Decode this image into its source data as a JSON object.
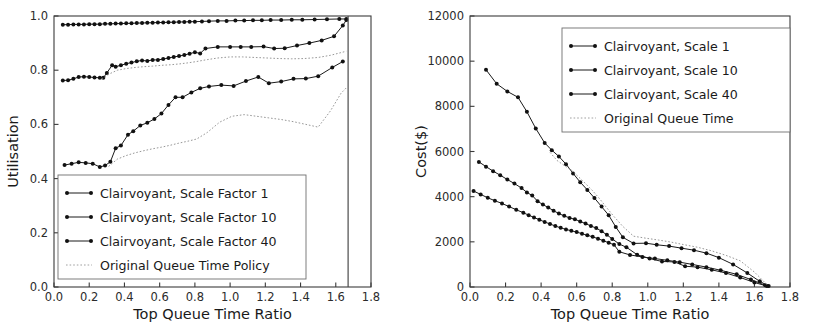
{
  "figure": {
    "background": "#ffffff",
    "ink": "#1a1a1a",
    "grid": false
  },
  "chart_data": [
    {
      "id": "utilisation",
      "type": "line",
      "title": "",
      "xlabel": "Top Queue Time Ratio",
      "ylabel": "Utilisation",
      "xlim": [
        0.0,
        1.8
      ],
      "ylim": [
        0.0,
        1.0
      ],
      "xticks": [
        "0.0",
        "0.2",
        "0.4",
        "0.6",
        "0.8",
        "1.0",
        "1.2",
        "1.4",
        "1.6",
        "1.8"
      ],
      "xtick_values": [
        0.0,
        0.2,
        0.4,
        0.6,
        0.8,
        1.0,
        1.2,
        1.4,
        1.6,
        1.8
      ],
      "yticks": [
        "0.0",
        "0.2",
        "0.4",
        "0.6",
        "0.8",
        "1.0"
      ],
      "ytick_values": [
        0.0,
        0.2,
        0.4,
        0.6,
        0.8,
        1.0
      ],
      "legend_position": "lower-left",
      "legend": [
        "Clairvoyant, Scale Factor 1",
        "Clairvoyant, Scale Factor 10",
        "Clairvoyant, Scale Factor 40",
        "Original Queue Time Policy"
      ],
      "series": [
        {
          "name": "Clairvoyant, Scale Factor 1",
          "style": "solid-marker",
          "x": [
            0.05,
            0.08,
            0.11,
            0.14,
            0.17,
            0.2,
            0.23,
            0.26,
            0.29,
            0.32,
            0.35,
            0.38,
            0.41,
            0.44,
            0.47,
            0.5,
            0.53,
            0.56,
            0.59,
            0.62,
            0.65,
            0.68,
            0.71,
            0.74,
            0.77,
            0.8,
            0.84,
            0.88,
            0.93,
            0.98,
            1.03,
            1.08,
            1.13,
            1.18,
            1.23,
            1.29,
            1.35,
            1.41,
            1.48,
            1.55,
            1.62,
            1.66
          ],
          "y": [
            0.968,
            0.968,
            0.969,
            0.969,
            0.969,
            0.97,
            0.97,
            0.97,
            0.971,
            0.971,
            0.972,
            0.972,
            0.973,
            0.973,
            0.974,
            0.974,
            0.975,
            0.975,
            0.976,
            0.976,
            0.977,
            0.977,
            0.978,
            0.978,
            0.979,
            0.979,
            0.98,
            0.981,
            0.982,
            0.982,
            0.983,
            0.983,
            0.984,
            0.984,
            0.985,
            0.985,
            0.986,
            0.986,
            0.987,
            0.988,
            0.989,
            0.989
          ]
        },
        {
          "name": "Clairvoyant, Scale Factor 10",
          "style": "solid-marker",
          "x": [
            0.05,
            0.08,
            0.11,
            0.14,
            0.17,
            0.2,
            0.23,
            0.26,
            0.28,
            0.3,
            0.33,
            0.35,
            0.38,
            0.41,
            0.44,
            0.47,
            0.5,
            0.53,
            0.56,
            0.59,
            0.62,
            0.65,
            0.68,
            0.71,
            0.74,
            0.77,
            0.8,
            0.83,
            0.86,
            0.93,
            1.0,
            1.06,
            1.12,
            1.19,
            1.25,
            1.31,
            1.38,
            1.45,
            1.52,
            1.59,
            1.64,
            1.66
          ],
          "y": [
            0.762,
            0.763,
            0.768,
            0.775,
            0.776,
            0.775,
            0.773,
            0.772,
            0.772,
            0.79,
            0.818,
            0.813,
            0.818,
            0.824,
            0.828,
            0.833,
            0.836,
            0.834,
            0.838,
            0.838,
            0.841,
            0.845,
            0.849,
            0.852,
            0.856,
            0.861,
            0.866,
            0.862,
            0.88,
            0.886,
            0.886,
            0.886,
            0.886,
            0.887,
            0.88,
            0.881,
            0.891,
            0.9,
            0.91,
            0.925,
            0.965,
            0.985
          ]
        },
        {
          "name": "Clairvoyant, Scale Factor 40",
          "style": "solid-marker",
          "x": [
            0.06,
            0.1,
            0.14,
            0.18,
            0.22,
            0.26,
            0.29,
            0.32,
            0.35,
            0.38,
            0.42,
            0.45,
            0.49,
            0.53,
            0.57,
            0.61,
            0.65,
            0.69,
            0.73,
            0.78,
            0.83,
            0.88,
            0.95,
            1.02,
            1.09,
            1.16,
            1.22,
            1.29,
            1.36,
            1.43,
            1.5,
            1.58,
            1.64
          ],
          "y": [
            0.45,
            0.455,
            0.46,
            0.458,
            0.455,
            0.443,
            0.448,
            0.462,
            0.512,
            0.522,
            0.562,
            0.575,
            0.596,
            0.606,
            0.62,
            0.64,
            0.672,
            0.7,
            0.7,
            0.718,
            0.733,
            0.74,
            0.745,
            0.742,
            0.76,
            0.775,
            0.752,
            0.758,
            0.768,
            0.769,
            0.778,
            0.81,
            0.832
          ]
        },
        {
          "name": "Original Queue Time Policy (upper)",
          "style": "dotted",
          "x": [
            0.27,
            0.32,
            0.36,
            0.41,
            0.46,
            0.51,
            0.56,
            0.61,
            0.66,
            0.71,
            0.76,
            0.81,
            0.86,
            0.93,
            1.0,
            1.07,
            1.14,
            1.21,
            1.28,
            1.35,
            1.42,
            1.5,
            1.57,
            1.63,
            1.66
          ],
          "y": [
            0.768,
            0.788,
            0.8,
            0.806,
            0.81,
            0.813,
            0.815,
            0.818,
            0.82,
            0.823,
            0.827,
            0.832,
            0.838,
            0.845,
            0.849,
            0.849,
            0.847,
            0.845,
            0.843,
            0.842,
            0.843,
            0.847,
            0.855,
            0.865,
            0.87
          ]
        },
        {
          "name": "Original Queue Time Policy (lower)",
          "style": "dotted",
          "x": [
            0.31,
            0.36,
            0.41,
            0.46,
            0.51,
            0.56,
            0.61,
            0.66,
            0.71,
            0.76,
            0.81,
            0.87,
            0.94,
            1.01,
            1.08,
            1.15,
            1.22,
            1.29,
            1.36,
            1.43,
            1.5,
            1.57,
            1.63,
            1.66
          ],
          "y": [
            0.445,
            0.472,
            0.485,
            0.495,
            0.503,
            0.51,
            0.516,
            0.523,
            0.531,
            0.538,
            0.546,
            0.57,
            0.608,
            0.63,
            0.636,
            0.63,
            0.624,
            0.618,
            0.61,
            0.6,
            0.59,
            0.65,
            0.715,
            0.735
          ]
        }
      ],
      "annotations": [
        {
          "type": "vertical-drop",
          "x": 1.67,
          "from": 1.0,
          "to": 0.0
        }
      ]
    },
    {
      "id": "cost",
      "type": "line",
      "title": "",
      "xlabel": "Top Queue Time Ratio",
      "ylabel": "Cost($)",
      "xlim": [
        0.0,
        1.8
      ],
      "ylim": [
        0,
        12000
      ],
      "xticks": [
        "0.0",
        "0.2",
        "0.4",
        "0.6",
        "0.8",
        "1.0",
        "1.2",
        "1.4",
        "1.6",
        "1.8"
      ],
      "xtick_values": [
        0.0,
        0.2,
        0.4,
        0.6,
        0.8,
        1.0,
        1.2,
        1.4,
        1.6,
        1.8
      ],
      "yticks": [
        "0",
        "2000",
        "4000",
        "6000",
        "8000",
        "10000",
        "12000"
      ],
      "ytick_values": [
        0,
        2000,
        4000,
        6000,
        8000,
        10000,
        12000
      ],
      "legend_position": "upper-right",
      "legend": [
        "Clairvoyant, Scale 1",
        "Clairvoyant, Scale 10",
        "Clairvoyant, Scale 40",
        "Original Queue Time"
      ],
      "series": [
        {
          "name": "Clairvoyant, Scale 1",
          "style": "solid-marker",
          "x": [
            0.09,
            0.15,
            0.21,
            0.27,
            0.32,
            0.37,
            0.42,
            0.46,
            0.5,
            0.54,
            0.58,
            0.62,
            0.66,
            0.7,
            0.74,
            0.78,
            0.82,
            0.86,
            0.92,
            0.99,
            1.05,
            1.12,
            1.19,
            1.26,
            1.33,
            1.4,
            1.48,
            1.56,
            1.63,
            1.68
          ],
          "y": [
            9620,
            9000,
            8660,
            8400,
            7760,
            7020,
            6380,
            6060,
            5780,
            5440,
            5030,
            4640,
            4300,
            3940,
            3560,
            3180,
            2660,
            2200,
            1930,
            1940,
            1870,
            1810,
            1720,
            1630,
            1500,
            1300,
            1000,
            620,
            250,
            40
          ]
        },
        {
          "name": "Clairvoyant, Scale 10",
          "style": "solid-marker",
          "x": [
            0.05,
            0.09,
            0.13,
            0.17,
            0.21,
            0.25,
            0.29,
            0.32,
            0.35,
            0.38,
            0.41,
            0.44,
            0.47,
            0.5,
            0.53,
            0.56,
            0.59,
            0.62,
            0.65,
            0.68,
            0.71,
            0.74,
            0.77,
            0.8,
            0.84,
            0.88,
            0.94,
            1.01,
            1.08,
            1.15,
            1.21,
            1.28,
            1.36,
            1.44,
            1.52,
            1.6,
            1.67
          ],
          "y": [
            5540,
            5330,
            5130,
            4950,
            4760,
            4580,
            4380,
            4190,
            4050,
            3800,
            3650,
            3520,
            3380,
            3250,
            3150,
            3060,
            3000,
            2900,
            2810,
            2700,
            2610,
            2470,
            2310,
            2130,
            1900,
            1760,
            1430,
            1260,
            1130,
            1110,
            920,
            880,
            760,
            620,
            420,
            200,
            40
          ]
        },
        {
          "name": "Clairvoyant, Scale 40",
          "style": "solid-marker",
          "x": [
            0.02,
            0.06,
            0.1,
            0.14,
            0.18,
            0.22,
            0.26,
            0.3,
            0.33,
            0.36,
            0.39,
            0.42,
            0.45,
            0.48,
            0.51,
            0.54,
            0.57,
            0.6,
            0.63,
            0.66,
            0.69,
            0.72,
            0.75,
            0.78,
            0.81,
            0.84,
            0.9,
            0.97,
            1.04,
            1.11,
            1.18,
            1.25,
            1.33,
            1.41,
            1.5,
            1.58,
            1.66
          ],
          "y": [
            4250,
            4100,
            3950,
            3820,
            3700,
            3560,
            3420,
            3290,
            3180,
            3080,
            2980,
            2880,
            2790,
            2700,
            2620,
            2550,
            2490,
            2430,
            2360,
            2290,
            2220,
            2140,
            2050,
            1960,
            1870,
            1560,
            1420,
            1330,
            1260,
            1180,
            1100,
            1000,
            880,
            740,
            560,
            330,
            80
          ]
        },
        {
          "name": "Original Queue Time",
          "style": "dotted",
          "x": [
            0.45,
            0.49,
            0.53,
            0.57,
            0.61,
            0.65,
            0.69,
            0.73,
            0.77,
            0.81,
            0.86,
            0.92,
            0.99,
            1.06,
            1.13,
            1.2,
            1.28,
            1.36,
            1.44,
            1.52,
            1.6,
            1.67
          ],
          "y": [
            5960,
            5600,
            5380,
            5180,
            4880,
            4580,
            4260,
            3900,
            3500,
            3120,
            2680,
            2250,
            2160,
            2080,
            1990,
            1880,
            1760,
            1600,
            1400,
            1160,
            660,
            110
          ]
        }
      ]
    }
  ]
}
